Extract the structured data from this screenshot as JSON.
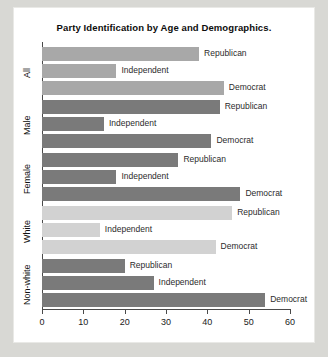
{
  "chart_data": {
    "type": "bar",
    "orientation": "horizontal",
    "title": "Party Identification by Age and Demographics.",
    "xlabel": "",
    "ylabel": "",
    "xlim": [
      0,
      60
    ],
    "xticks": [
      "0",
      "10",
      "20",
      "30",
      "40",
      "50",
      "60"
    ],
    "xtick_values": [
      0,
      10,
      20,
      30,
      40,
      50,
      60
    ],
    "grid": false,
    "legend": "none",
    "categories": [
      "All",
      "Male",
      "Female",
      "White",
      "Non-white"
    ],
    "series": [
      {
        "name": "Republican",
        "values": [
          38,
          43,
          33,
          46,
          20
        ]
      },
      {
        "name": "Independent",
        "values": [
          18,
          15,
          18,
          14,
          27
        ]
      },
      {
        "name": "Democrat",
        "values": [
          44,
          41,
          48,
          42,
          54
        ]
      }
    ],
    "groups": [
      {
        "category": "All",
        "bar_color": "#a8a8a8",
        "bars": [
          {
            "label": "Republican",
            "value": 38
          },
          {
            "label": "Independent",
            "value": 18
          },
          {
            "label": "Democrat",
            "value": 44
          }
        ]
      },
      {
        "category": "Male",
        "bar_color": "#7a7a7a",
        "bars": [
          {
            "label": "Republican",
            "value": 43
          },
          {
            "label": "Independent",
            "value": 15
          },
          {
            "label": "Democrat",
            "value": 41
          }
        ]
      },
      {
        "category": "Female",
        "bar_color": "#7a7a7a",
        "bars": [
          {
            "label": "Republican",
            "value": 33
          },
          {
            "label": "Independent",
            "value": 18
          },
          {
            "label": "Democrat",
            "value": 48
          }
        ]
      },
      {
        "category": "White",
        "bar_color": "#d2d2d2",
        "bars": [
          {
            "label": "Republican",
            "value": 46
          },
          {
            "label": "Independent",
            "value": 14
          },
          {
            "label": "Democrat",
            "value": 42
          }
        ]
      },
      {
        "category": "Non-white",
        "bar_color": "#7a7a7a",
        "bars": [
          {
            "label": "Republican",
            "value": 20
          },
          {
            "label": "Independent",
            "value": 27
          },
          {
            "label": "Democrat",
            "value": 54
          }
        ]
      }
    ],
    "colors": {
      "axis": "#4a4a4a",
      "text": "#1a1a1a",
      "plot_background": "#ffffff",
      "page_background": "#d8d8d4"
    }
  }
}
